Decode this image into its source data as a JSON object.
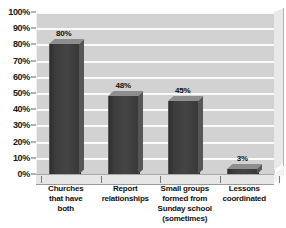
{
  "chart_data": {
    "type": "bar",
    "title": "",
    "xlabel": "",
    "ylabel": "",
    "ylim": [
      0,
      100
    ],
    "grid": true,
    "legend": "none",
    "categories": [
      "Churches that have both",
      "Report relationships",
      "Small groups formed from Sunday school (sometimes)",
      "Lessons coordinated"
    ],
    "category_lines": [
      [
        "Churches",
        "that have",
        "both"
      ],
      [
        "Report",
        "relationships"
      ],
      [
        "Small groups",
        "formed from",
        "Sunday school",
        "(sometimes)"
      ],
      [
        "Lessons",
        "coordinated"
      ]
    ],
    "values": [
      80,
      48,
      45,
      3
    ],
    "value_labels": [
      "80%",
      "48%",
      "45%",
      "3%"
    ],
    "ytick_values": [
      0,
      10,
      20,
      30,
      40,
      50,
      60,
      70,
      80,
      90,
      100
    ],
    "ytick_labels": [
      "0%",
      "10%",
      "20%",
      "30%",
      "40%",
      "50%",
      "60%",
      "70%",
      "80%",
      "90%",
      "100%"
    ]
  },
  "style": {
    "plot_background": "#d2d2d2",
    "gridline_color": "#fbfbfb",
    "bar_color": "#3d3d3d",
    "bar_top_color": "#8e8e8e",
    "bar_side_color": "#565656",
    "text_color": "#111111",
    "page_background": "#ffffff"
  }
}
